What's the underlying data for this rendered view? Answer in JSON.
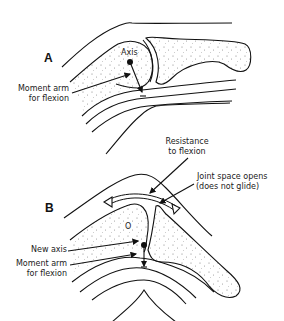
{
  "figure": {
    "panels": [
      {
        "id": "A",
        "label": "A",
        "annotations": {
          "axis": "Axis",
          "moment_arm_line1": "Moment arm",
          "moment_arm_line2": "for flexion"
        }
      },
      {
        "id": "B",
        "label": "B",
        "annotations": {
          "resistance_line1": "Resistance",
          "resistance_line2": "to flexion",
          "joint_space_line1": "Joint space opens",
          "joint_space_line2": "(does not glide)",
          "new_axis": "New axis",
          "moment_arm_line1": "Moment arm",
          "moment_arm_line2": "for flexion",
          "old_axis_marker": "O"
        }
      }
    ],
    "colors": {
      "ink": "#111111",
      "background": "#ffffff",
      "stipple": "#888888"
    }
  }
}
